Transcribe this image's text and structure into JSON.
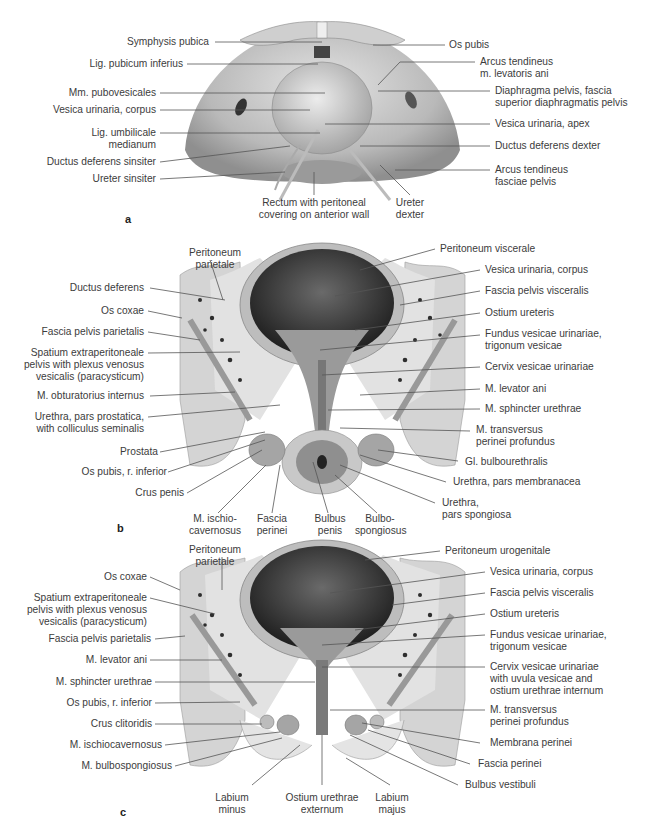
{
  "figure": {
    "panels": [
      {
        "id": "a",
        "letter": "a",
        "labels_left": [
          "Symphysis pubica",
          "Lig. pubicum inferius",
          "Mm. pubovesicales",
          "Vesica urinaria, corpus",
          "Lig. umbilicale\nmedianum",
          "Ductus deferens sinsiter",
          "Ureter sinsiter"
        ],
        "labels_right": [
          "Os pubis",
          "Arcus tendineus\nm. levatoris ani",
          "Diaphragma pelvis, fascia\nsuperior diaphragmatis pelvis",
          "Vesica urinaria, apex",
          "Ductus deferens dexter",
          "Arcus tendineus\nfasciae pelvis"
        ],
        "labels_bottom": [
          "Rectum with peritoneal\ncovering on anterior wall",
          "Ureter\ndexter"
        ]
      },
      {
        "id": "b",
        "letter": "b",
        "labels_top": [
          "Peritoneum\nparietale"
        ],
        "labels_left": [
          "Ductus deferens",
          "Os coxae",
          "Fascia pelvis parietalis",
          "Spatium extraperitoneale\npelvis with plexus venosus\nvesicalis (paracysticum)",
          "M. obturatorius internus",
          "Urethra, pars prostatica,\nwith colliculus seminalis",
          "Prostata",
          "Os pubis, r. inferior",
          "Crus penis"
        ],
        "labels_right": [
          "Peritoneum viscerale",
          "Vesica urinaria, corpus",
          "Fascia pelvis visceralis",
          "Ostium ureteris",
          "Fundus vesicae urinariae,\ntrigonum vesicae",
          "Cervix vesicae urinariae",
          "M. levator ani",
          "M. sphincter urethrae",
          "M. transversus\nperinei profundus",
          "Gl. bulbourethralis",
          "Urethra, pars membranacea",
          "Urethra,\npars spongiosa"
        ],
        "labels_bottom": [
          "M. ischio-\ncavernosus",
          "Fascia\nperinei",
          "Bulbus\npenis",
          "Bulbo-\nspongiosus"
        ]
      },
      {
        "id": "c",
        "letter": "c",
        "labels_top": [
          "Peritoneum\nparietale"
        ],
        "labels_left": [
          "Os coxae",
          "Spatium extraperitoneale\npelvis with plexus venosus\nvesicalis (paracysticum)",
          "Fascia pelvis parietalis",
          "M. levator ani",
          "M. sphincter urethrae",
          "Os pubis, r. inferior",
          "Crus clitoridis",
          "M. ischiocavernosus",
          "M. bulbospongiosus"
        ],
        "labels_right": [
          "Peritoneum urogenitale",
          "Vesica urinaria, corpus",
          "Fascia pelvis visceralis",
          "Ostium ureteris",
          "Fundus vesicae urinariae,\ntrigonum vesicae",
          "Cervix vesicae urinariae\nwith uvula vesicae and\nostium urethrae internum",
          "M. transversus\nperinei profundus",
          "Membrana perinei",
          "Fascia perinei",
          "Bulbus vestibuli"
        ],
        "labels_bottom": [
          "Labium\nminus",
          "Ostium urethrae\nexternum",
          "Labium\nmajus"
        ]
      }
    ],
    "colors": {
      "label_text": "#3c3c3c",
      "leader_line": "#555555",
      "tissue_light": "#d9d9d9",
      "tissue_mid": "#a8a8a8",
      "lumen_dark": "#2a2a2a"
    }
  }
}
